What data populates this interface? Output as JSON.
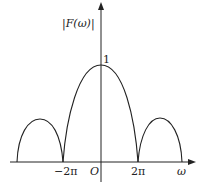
{
  "figure": {
    "ylabel": "|F(ω)|",
    "xlabel": "ω",
    "origin_label": "O",
    "peak_label": "1",
    "x_ticks": [
      "−2π",
      "2π"
    ]
  },
  "colors": {
    "stroke": "#222222",
    "background": "#ffffff"
  }
}
